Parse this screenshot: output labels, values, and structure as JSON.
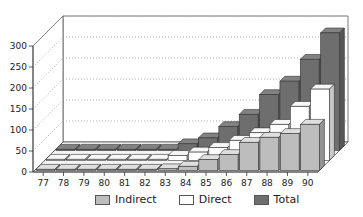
{
  "chart_data": {
    "type": "bar",
    "subtype": "3d-grouped-depth",
    "title": "",
    "xlabel": "",
    "ylabel": "",
    "ylim": [
      0,
      300
    ],
    "yticks": [
      0,
      50,
      100,
      150,
      200,
      250,
      300
    ],
    "grid": true,
    "legend_position": "bottom",
    "categories": [
      "77",
      "78",
      "79",
      "80",
      "81",
      "82",
      "83",
      "84",
      "85",
      "86",
      "87",
      "88",
      "89",
      "90"
    ],
    "series": [
      {
        "name": "Indirect",
        "color": "#bdbdbd",
        "values": [
          0,
          0,
          0,
          0,
          0,
          0,
          4,
          10,
          26,
          38,
          67,
          79,
          88,
          110
        ]
      },
      {
        "name": "Direct",
        "color": "#ffffff",
        "values": [
          0,
          0,
          0,
          0,
          0,
          2,
          12,
          20,
          31,
          48,
          66,
          86,
          129,
          170
        ]
      },
      {
        "name": "Total",
        "color": "#6e6e6e",
        "values": [
          0,
          0,
          0,
          0,
          0,
          2,
          16,
          30,
          57,
          86,
          133,
          165,
          217,
          280
        ]
      }
    ]
  },
  "legend": {
    "items": [
      {
        "label": "Indirect",
        "color": "#bdbdbd"
      },
      {
        "label": "Direct",
        "color": "#ffffff"
      },
      {
        "label": "Total",
        "color": "#6e6e6e"
      }
    ]
  }
}
